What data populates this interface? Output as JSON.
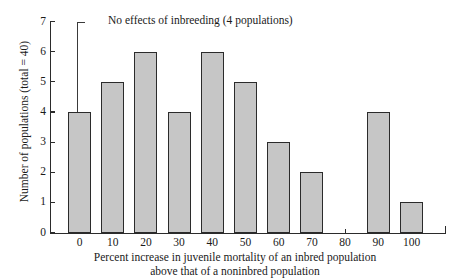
{
  "chart_data": {
    "type": "bar",
    "title": "",
    "xlabel": "Percent increase in juvenile mortality of an inbred population above that of a noninbred population",
    "xlabel_line1": "Percent increase in juvenile mortality of an inbred population",
    "xlabel_line2": "above that of a noninbred population",
    "ylabel": "Number of populations (total = 40)",
    "categories": [
      "0",
      "10",
      "20",
      "30",
      "40",
      "50",
      "60",
      "70",
      "80",
      "90",
      "100"
    ],
    "values": [
      4,
      5,
      6,
      4,
      6,
      5,
      3,
      2,
      0,
      4,
      1
    ],
    "xlim": [
      -7,
      113
    ],
    "ylim": [
      0,
      7
    ],
    "y_ticks": [
      "0",
      "1",
      "2",
      "3",
      "4",
      "5",
      "6",
      "7"
    ],
    "x_ticks": [
      "0",
      "10",
      "20",
      "30",
      "40",
      "50",
      "60",
      "70",
      "80",
      "90",
      "100"
    ],
    "grid": false,
    "legend": false,
    "annotations": [
      {
        "text": "No effects of inbreeding (4 populations)",
        "points_to_category": "0",
        "points_to_value": 4
      }
    ],
    "colors": {
      "bar_fill": "#c6c6c6",
      "bar_edge": "#2b2b2b",
      "axis": "#2b2b2b",
      "text": "#1a1a1a",
      "background": "#ffffff"
    }
  }
}
